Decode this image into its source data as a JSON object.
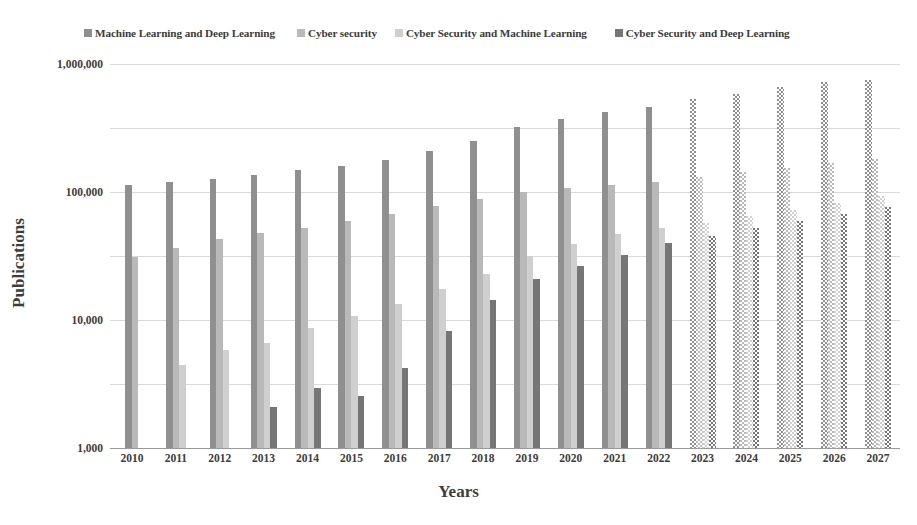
{
  "chart_data": {
    "type": "bar",
    "title": "",
    "xlabel": "Years",
    "ylabel": "Publications",
    "yscale": "log",
    "ylim": [
      1,
      1000000
    ],
    "ytick_labels": [
      "1",
      "10",
      "100",
      "1,000",
      "10,000",
      "100,000",
      "1,000,000"
    ],
    "ytick_values": [
      1,
      10,
      100,
      1000,
      10000,
      100000,
      1000000
    ],
    "grid": true,
    "legend_position": "top",
    "categories": [
      "2010",
      "2011",
      "2012",
      "2013",
      "2014",
      "2015",
      "2016",
      "2017",
      "2018",
      "2019",
      "2020",
      "2021",
      "2022",
      "2023",
      "2024",
      "2025",
      "2026",
      "2027"
    ],
    "forecast_from": "2023",
    "forecast_note": "Bars for 2023-2027 are drawn with a checkered/hatched fill indicating projected values",
    "series": [
      {
        "name": "Machine Learning and Deep Learning",
        "color": "#8f8f8f",
        "values": [
          13000,
          14500,
          16000,
          18500,
          22000,
          25500,
          32000,
          44000,
          63000,
          103000,
          140000,
          180000,
          215000,
          280000,
          345000,
          430000,
          520000,
          570000
        ]
      },
      {
        "name": "Cyber security",
        "color": "#b9b9b9",
        "values": [
          950,
          1350,
          1850,
          2300,
          2700,
          3500,
          4500,
          6000,
          7800,
          10000,
          11500,
          13000,
          14500,
          17000,
          20500,
          24000,
          28500,
          33000
        ]
      },
      {
        "name": "Cyber Security and Machine Learning",
        "color": "#cfcfcf",
        "values": [
          null,
          20,
          34,
          43,
          75,
          115,
          175,
          300,
          520,
          1000,
          1550,
          2200,
          2750,
          3300,
          4200,
          5300,
          6800,
          8600
        ]
      },
      {
        "name": "Cyber Security and Deep Learning",
        "color": "#767676",
        "values": [
          null,
          null,
          null,
          4.3,
          8.6,
          6.5,
          18,
          67,
          205,
          430,
          700,
          1050,
          1600,
          2050,
          2700,
          3500,
          4600,
          5800
        ]
      }
    ]
  },
  "legend": {
    "items": [
      {
        "label": "Machine Learning and Deep Learning",
        "color": "#8f8f8f"
      },
      {
        "label": "Cyber security",
        "color": "#b9b9b9"
      },
      {
        "label": "Cyber Security and Machine Learning",
        "color": "#cfcfcf"
      },
      {
        "label": "Cyber Security and Deep Learning",
        "color": "#767676"
      }
    ]
  },
  "axes": {
    "y_title": "Publications",
    "x_title": "Years"
  }
}
